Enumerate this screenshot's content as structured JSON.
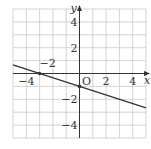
{
  "chart_data": {
    "type": "line",
    "title": "",
    "xlabel": "x",
    "ylabel": "y",
    "origin_label": "O",
    "xlim": [
      -5,
      5
    ],
    "ylim": [
      -5,
      5
    ],
    "grid": true,
    "grid_step": 1,
    "x_tick_labels": [
      {
        "value": -4,
        "label": "−4"
      },
      {
        "value": 2,
        "label": "2"
      },
      {
        "value": 4,
        "label": "4"
      }
    ],
    "y_tick_labels": [
      {
        "value": 4,
        "label": "4"
      },
      {
        "value": 2,
        "label": "2"
      },
      {
        "value": -2,
        "label": "−2"
      },
      {
        "value": -4,
        "label": "−4"
      }
    ],
    "annotations": [
      {
        "text": "−2",
        "x": -2.4,
        "y": 0.4
      }
    ],
    "series": [
      {
        "name": "y = -x/3 - 1",
        "x": [
          -5,
          5
        ],
        "values": [
          0.667,
          -2.667
        ],
        "marked_points": [
          [
            -3,
            0
          ],
          [
            0,
            -1
          ]
        ]
      }
    ]
  },
  "colors": {
    "grid": "#c8c8c8",
    "axis": "#333333",
    "line": "#333333"
  }
}
